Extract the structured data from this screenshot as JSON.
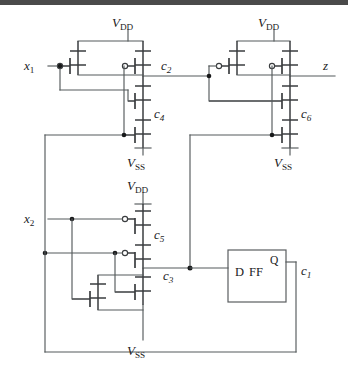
{
  "figure": {
    "type": "cmos-circuit-schematic"
  },
  "labels": {
    "input_x1": {
      "base": "x",
      "sub": "1"
    },
    "input_x2": {
      "base": "x",
      "sub": "2"
    },
    "output_z": {
      "base": "z",
      "sub": ""
    },
    "net_c1": {
      "base": "c",
      "sub": "1"
    },
    "net_c2": {
      "base": "c",
      "sub": "2"
    },
    "net_c3": {
      "base": "c",
      "sub": "3"
    },
    "net_c4": {
      "base": "c",
      "sub": "4"
    },
    "net_c5": {
      "base": "c",
      "sub": "5"
    },
    "net_c6": {
      "base": "c",
      "sub": "6"
    },
    "supply_vdd": {
      "base": "V",
      "sub": "DD"
    },
    "supply_vss": {
      "base": "V",
      "sub": "SS"
    }
  },
  "power_rails": {
    "vdd_top_left": {
      "base": "V",
      "sub": "DD"
    },
    "vdd_top_right": {
      "base": "V",
      "sub": "DD"
    },
    "vdd_mid": {
      "base": "V",
      "sub": "DD"
    },
    "vss_left": {
      "base": "V",
      "sub": "SS"
    },
    "vss_right": {
      "base": "V",
      "sub": "SS"
    },
    "vss_bottom": {
      "base": "V",
      "sub": "SS"
    }
  },
  "flipflop": {
    "body_label": "D  FF",
    "d_label": "D",
    "ff_label": "FF",
    "q_label": "Q",
    "out_net": {
      "base": "c",
      "sub": "1"
    }
  },
  "colors": {
    "wire": "#555a5c",
    "device": "#3a3d3f",
    "node": "#18191a",
    "text": "#1b1c1d",
    "background": "#ffffff",
    "topbar": "#4a4a4a"
  },
  "nets": [
    {
      "name": "x1",
      "role": "primary-input"
    },
    {
      "name": "x2",
      "role": "primary-input"
    },
    {
      "name": "c1",
      "role": "flip-flop-output-feedback"
    },
    {
      "name": "c2",
      "role": "internal"
    },
    {
      "name": "c3",
      "role": "internal"
    },
    {
      "name": "c4",
      "role": "internal"
    },
    {
      "name": "c5",
      "role": "internal"
    },
    {
      "name": "c6",
      "role": "internal"
    },
    {
      "name": "z",
      "role": "primary-output"
    }
  ]
}
